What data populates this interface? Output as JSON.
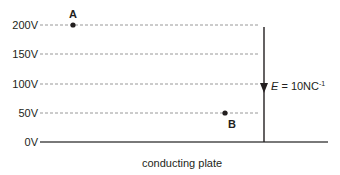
{
  "diagram": {
    "equipotentials": [
      {
        "label": "200V",
        "value": 200,
        "y": 25
      },
      {
        "label": "150V",
        "value": 150,
        "y": 54
      },
      {
        "label": "100V",
        "value": 100,
        "y": 84
      },
      {
        "label": "50V",
        "value": 50,
        "y": 113
      },
      {
        "label": "0V",
        "value": 0,
        "y": 142
      }
    ],
    "points": {
      "A": {
        "label": "A",
        "potential": "200V"
      },
      "B": {
        "label": "B",
        "potential": "50V"
      }
    },
    "field": {
      "symbol": "E",
      "equals": " = 10NC",
      "exponent": "-1",
      "direction": "down"
    },
    "plate_label": "conducting plate",
    "colors": {
      "ink": "#231f20",
      "dash": "#8c8c8c",
      "plate": "#4d4d4d"
    }
  }
}
